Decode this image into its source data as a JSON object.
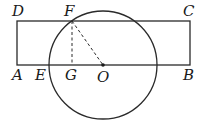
{
  "diagram": {
    "type": "geometry",
    "shapes": {
      "rectangle": {
        "vertices": [
          "A",
          "B",
          "C",
          "D"
        ]
      },
      "circle": {
        "center": "O"
      },
      "segments_dashed": [
        "FG",
        "FO"
      ]
    },
    "labels": {
      "A": "A",
      "B": "B",
      "C": "C",
      "D": "D",
      "E": "E",
      "F": "F",
      "G": "G",
      "O": "O"
    },
    "colors": {
      "stroke": "#2a2a2a",
      "background": "#ffffff"
    }
  }
}
